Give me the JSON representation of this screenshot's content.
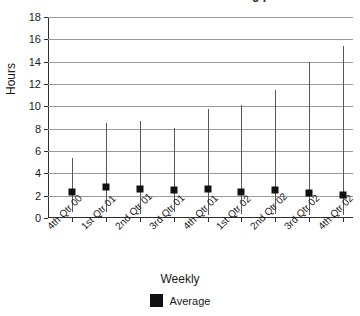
{
  "chart_data": {
    "type": "scatter",
    "title": "",
    "xlabel": "Weekly",
    "ylabel": "Hours",
    "ylim": [
      0,
      18
    ],
    "ytick_step": 2,
    "yticks": [
      18,
      16,
      14,
      12,
      10,
      8,
      6,
      4,
      2,
      0
    ],
    "grid": true,
    "legend_position": "bottom",
    "legend": [
      {
        "label": "Average",
        "color": "#111111",
        "marker": "square"
      }
    ],
    "categories": [
      "4th Qtr 00",
      "1st Qtr 01",
      "2nd Qtr 01",
      "3rd Qtr 01",
      "4th Qtr 01",
      "1st Qtr 02",
      "2nd Qtr 02",
      "3rd Qtr 02",
      "4th Qtr 02"
    ],
    "series": [
      {
        "name": "Average",
        "values": [
          2.3,
          2.8,
          2.6,
          2.5,
          2.6,
          2.3,
          2.5,
          2.2,
          2.1
        ]
      }
    ],
    "error_bars": {
      "max": [
        5.4,
        8.5,
        8.7,
        8.1,
        9.8,
        10.1,
        11.5,
        14.0,
        15.4
      ],
      "min": [
        0.5,
        0.5,
        0.4,
        0.5,
        0.3,
        0.4,
        0.4,
        0.3,
        0.3
      ]
    },
    "colors": {
      "marker": "#111111",
      "errorbar": "#585858",
      "grid": "#9a9a9a",
      "axis": "#2d2d2d",
      "background": "#ffffff"
    }
  },
  "title_remnant": "g p"
}
